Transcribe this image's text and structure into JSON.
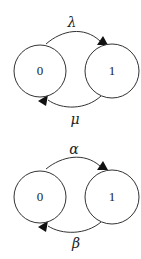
{
  "diagrams": [
    {
      "name": "markov-chain-top",
      "states": [
        {
          "label": "0"
        },
        {
          "label": "1"
        }
      ],
      "transitions": [
        {
          "from": "0",
          "to": "1",
          "label": "λ"
        },
        {
          "from": "1",
          "to": "0",
          "label": "μ"
        }
      ]
    },
    {
      "name": "markov-chain-bottom",
      "states": [
        {
          "label": "0"
        },
        {
          "label": "1"
        }
      ],
      "transitions": [
        {
          "from": "0",
          "to": "1",
          "label": "α"
        },
        {
          "from": "1",
          "to": "0",
          "label": "β"
        }
      ]
    }
  ]
}
